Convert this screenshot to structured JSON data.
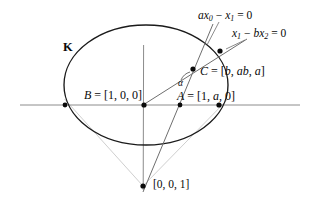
{
  "figure": {
    "conic_label": "K",
    "angle_label": "α",
    "lines": {
      "line1_label_parts": {
        "pre": "ax",
        "sub1": "0",
        "mid": " − x",
        "sub2": "1",
        "post": " = 0"
      },
      "line1_label": "ax0 − x1 = 0",
      "line2_label_parts": {
        "pre": "x",
        "sub1": "1",
        "mid": " − bx",
        "sub2": "2",
        "post": " = 0"
      },
      "line2_label": "x1 − bx2 = 0"
    },
    "points": [
      {
        "id": "A",
        "label": "A = [1, a, 0]",
        "coords": "[1, a, 0]"
      },
      {
        "id": "B",
        "label": "B = [1, 0, 0]",
        "coords": "[1, 0, 0]"
      },
      {
        "id": "C",
        "label": "C = [b, ab, a]",
        "coords": "[b, ab, a]"
      },
      {
        "id": "V",
        "label": "[0, 0, 1]",
        "coords": "[0, 0, 1]"
      }
    ],
    "colors": {
      "ink": "#0a0a0a",
      "conic_stroke": "#1a1a1a",
      "axis_stroke": "#8c8c8c",
      "ray_stroke": "#c9c9c9",
      "line_stroke": "#6e6e6e",
      "dot_fill": "#0a0a0a",
      "background": "#ffffff"
    }
  }
}
